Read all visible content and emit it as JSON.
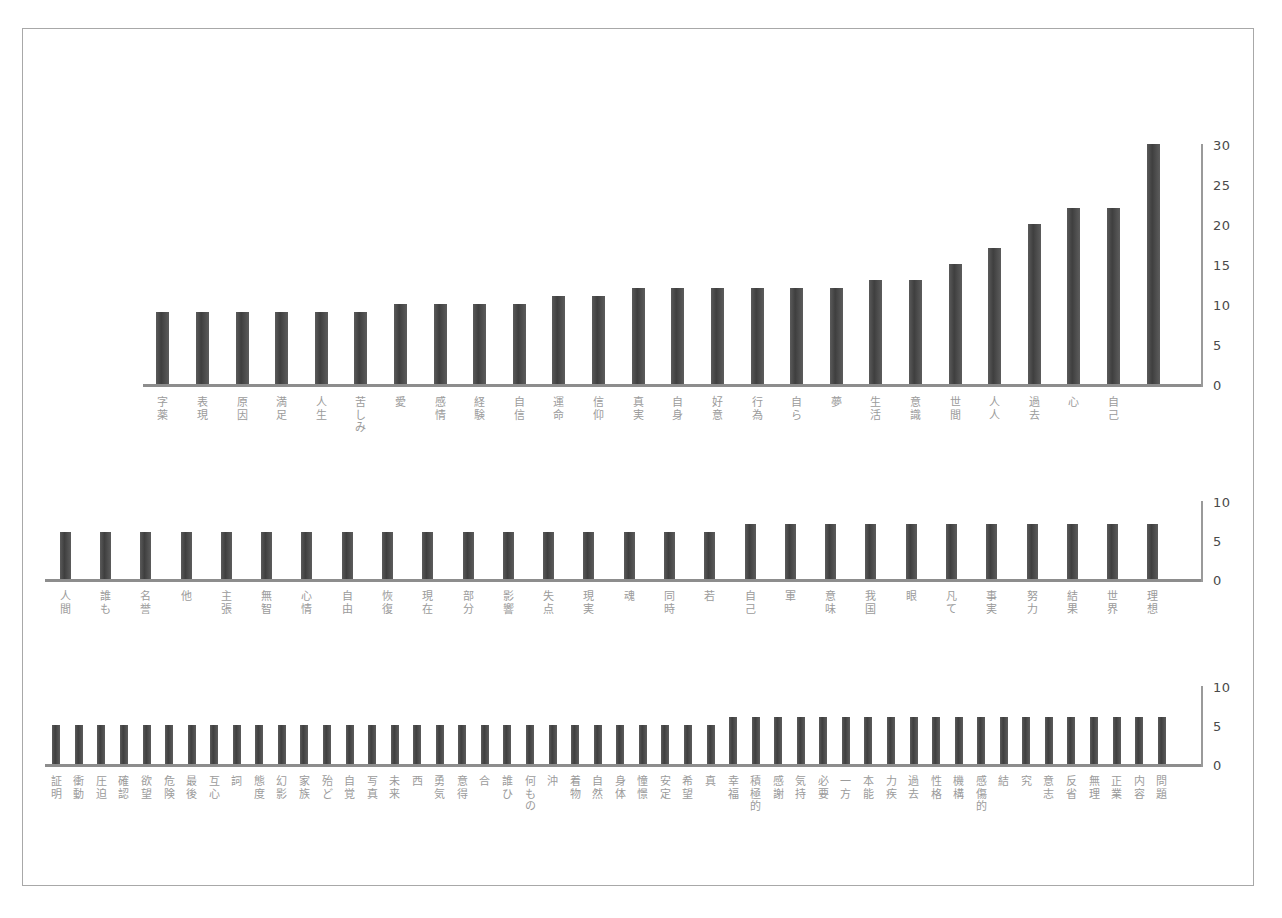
{
  "document": {
    "kind": "scanned-page-with-bar-charts",
    "border_color": "#a8a8a8",
    "background_color": "#ffffff",
    "bar_color": "#4d4d4d",
    "axis_color": "#8d8d8d",
    "label_color": "#9b9b9b"
  },
  "chart_data": [
    {
      "id": "chart-1",
      "type": "bar",
      "title": "",
      "xlabel": "",
      "ylabel": "",
      "ylim": [
        0,
        30
      ],
      "yticks": [
        0,
        5,
        10,
        15,
        20,
        25,
        30
      ],
      "grid": false,
      "legend": "none",
      "orientation": "vertical",
      "categories": [
        "字薬",
        "表現",
        "原因",
        "満足",
        "人生",
        "苦しみ",
        "愛",
        "感情",
        "経験",
        "自信",
        "運命",
        "信仰",
        "真実",
        "自身",
        "好意",
        "行為",
        "自ら",
        "夢",
        "生活",
        "意識",
        "世間",
        "人人",
        "過去",
        "心",
        "自己"
      ],
      "values": [
        9,
        9,
        9,
        9,
        9,
        9,
        10,
        10,
        10,
        10,
        11,
        11,
        12,
        12,
        12,
        12,
        12,
        12,
        13,
        13,
        15,
        17,
        20,
        22,
        22,
        30
      ]
    },
    {
      "id": "chart-2",
      "type": "bar",
      "title": "",
      "xlabel": "",
      "ylabel": "",
      "ylim": [
        0,
        10
      ],
      "yticks": [
        0,
        5,
        10
      ],
      "grid": false,
      "legend": "none",
      "orientation": "vertical",
      "categories": [
        "人間",
        "誰も",
        "名誉",
        "他",
        "主張",
        "無智",
        "心情",
        "自由",
        "恢復",
        "現在",
        "部分",
        "影響",
        "失点",
        "現実",
        "魂",
        "同時",
        "若",
        "自己",
        "軍",
        "意味",
        "我国",
        "眼",
        "凡て",
        "事実",
        "努力",
        "結果",
        "世界",
        "理想"
      ],
      "values": [
        6,
        6,
        6,
        6,
        6,
        6,
        6,
        6,
        6,
        6,
        6,
        6,
        6,
        6,
        6,
        6,
        6,
        7,
        7,
        7,
        7,
        7,
        7,
        7,
        7,
        7,
        7,
        7
      ]
    },
    {
      "id": "chart-3",
      "type": "bar",
      "title": "",
      "xlabel": "",
      "ylabel": "",
      "ylim": [
        0,
        10
      ],
      "yticks": [
        0,
        5,
        10
      ],
      "grid": false,
      "legend": "none",
      "orientation": "vertical",
      "categories": [
        "証明",
        "衝動",
        "圧迫",
        "確認",
        "欲望",
        "危険",
        "最後",
        "互心",
        "詞",
        "態度",
        "幻影",
        "家族",
        "殆ど",
        "自覚",
        "写真",
        "未来",
        "西",
        "勇気",
        "意得",
        "合",
        "誰ひ",
        "何もの",
        "沖",
        "着物",
        "自然",
        "身体",
        "憧憬",
        "安定",
        "希望",
        "真",
        "幸福",
        "積極的",
        "感謝",
        "気持",
        "必要",
        "一方",
        "本能",
        "力疾",
        "過去",
        "性格",
        "機構",
        "感傷的",
        "結",
        "究",
        "意志",
        "反省",
        "無理",
        "正業",
        "内容",
        "問題"
      ],
      "values": [
        5,
        5,
        5,
        5,
        5,
        5,
        5,
        5,
        5,
        5,
        5,
        5,
        5,
        5,
        5,
        5,
        5,
        5,
        5,
        5,
        5,
        5,
        5,
        5,
        5,
        5,
        5,
        5,
        5,
        5,
        6,
        6,
        6,
        6,
        6,
        6,
        6,
        6,
        6,
        6,
        6,
        6,
        6,
        6,
        6,
        6,
        6,
        6,
        6,
        6
      ]
    }
  ]
}
